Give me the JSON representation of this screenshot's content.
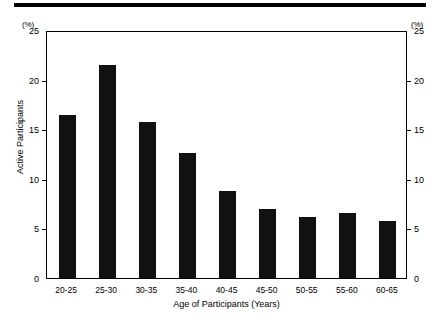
{
  "chart_data": {
    "type": "bar",
    "title": "",
    "xlabel": "Age of Participants (Years)",
    "ylabel": "Active Participants",
    "unit_caption_left": "(%)",
    "unit_caption_right": "(%)",
    "categories": [
      "20-25",
      "25-30",
      "30-35",
      "35-40",
      "40-45",
      "45-50",
      "50-55",
      "55-60",
      "60-65"
    ],
    "values": [
      16.4,
      21.5,
      15.7,
      12.6,
      8.8,
      7.0,
      6.2,
      6.6,
      5.7
    ],
    "ylim": [
      0,
      25
    ],
    "yticks": [
      0,
      5,
      10,
      15,
      20,
      25
    ],
    "ytick_labels": [
      "0",
      "5",
      "10",
      "15",
      "20",
      "25"
    ],
    "right_axis": {
      "mirrors_left": true,
      "ylim": [
        0,
        25
      ],
      "yticks": [
        0,
        5,
        10,
        15,
        20,
        25
      ],
      "ytick_labels": [
        "0",
        "5",
        "10",
        "15",
        "20",
        "25"
      ]
    },
    "grid": false,
    "legend": null,
    "bar_color": "#111111",
    "background_color": "#ffffff",
    "axis_color": "#000000"
  }
}
